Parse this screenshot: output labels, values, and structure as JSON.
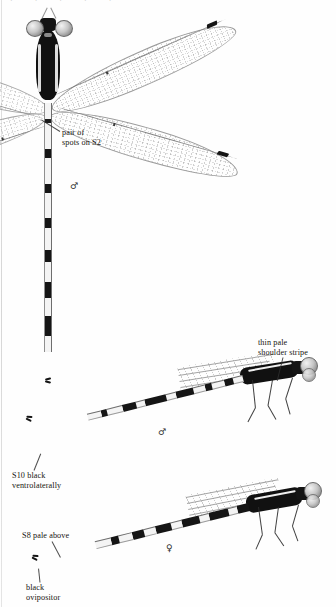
{
  "plate": {
    "title": "Damselfly identification plate",
    "background_color": "#fefefe",
    "ink_color": "#141414",
    "cutoff_text": "· · · · ·"
  },
  "annotations": [
    {
      "id": "pair-of-spots",
      "text": "pair of\nspots on S2",
      "x": 62,
      "y": 128,
      "align": "left",
      "leader": {
        "x": 60,
        "y": 131,
        "length": 22,
        "angle": -148
      }
    },
    {
      "id": "thin-pale-shoulder-stripe",
      "text": "thin pale\nshoulder stripe",
      "x": 258,
      "y": 338,
      "align": "left",
      "leader": {
        "x": 283,
        "y": 357,
        "length": 24,
        "angle": 104
      }
    },
    {
      "id": "s10-black-ventrolaterally",
      "text": "S10 black\nventrolaterally",
      "x": 12,
      "y": 471,
      "align": "left",
      "leader": {
        "x": 34,
        "y": 470,
        "length": 18,
        "angle": -68
      }
    },
    {
      "id": "s8-pale-above",
      "text": "S8 pale above",
      "x": 22,
      "y": 531,
      "align": "left",
      "leader": {
        "x": 52,
        "y": 541,
        "length": 18,
        "angle": 62
      }
    },
    {
      "id": "black-ovipositor",
      "text": "black\novipositor",
      "x": 26,
      "y": 583,
      "align": "left",
      "leader": {
        "x": 40,
        "y": 582,
        "length": 14,
        "angle": -96
      }
    }
  ],
  "sex_symbols": [
    {
      "id": "male-dorsal",
      "glyph": "♂",
      "x": 70,
      "y": 181
    },
    {
      "id": "male-lateral",
      "glyph": "♂",
      "x": 158,
      "y": 427
    },
    {
      "id": "female-lateral",
      "glyph": "♀",
      "x": 166,
      "y": 543
    }
  ],
  "specimens": [
    {
      "id": "specimen-dorsal-male",
      "view": "dorsal",
      "sex": "male",
      "wings": 4,
      "abdomen_segments": 10,
      "pterostigma_color": "#161616"
    },
    {
      "id": "specimen-lateral-male",
      "view": "lateral",
      "sex": "male",
      "wings": 4,
      "abdomen_segments": 10,
      "pterostigma_color": "#161616"
    },
    {
      "id": "specimen-lateral-female",
      "view": "lateral",
      "sex": "female",
      "wings": 4,
      "abdomen_segments": 10,
      "pterostigma_color": "#161616"
    }
  ],
  "abdomen_pattern_dorsal": [
    {
      "len": 16,
      "type": "pale"
    },
    {
      "len": 4,
      "type": "ring"
    },
    {
      "len": 26,
      "type": "pale"
    },
    {
      "len": 9,
      "type": "dark"
    },
    {
      "len": 26,
      "type": "pale"
    },
    {
      "len": 9,
      "type": "dark"
    },
    {
      "len": 25,
      "type": "pale"
    },
    {
      "len": 10,
      "type": "dark"
    },
    {
      "len": 22,
      "type": "pale"
    },
    {
      "len": 12,
      "type": "dark"
    },
    {
      "len": 20,
      "type": "pale"
    },
    {
      "len": 16,
      "type": "dark"
    },
    {
      "len": 18,
      "type": "pale"
    },
    {
      "len": 20,
      "type": "dark"
    },
    {
      "len": 16,
      "type": "pale"
    }
  ],
  "abdomen_pattern_lateral_male": [
    {
      "len": 10,
      "type": "pale"
    },
    {
      "len": 9,
      "type": "dark"
    },
    {
      "len": 13,
      "type": "pale"
    },
    {
      "len": 7,
      "type": "dark"
    },
    {
      "len": 12,
      "type": "pale"
    },
    {
      "len": 18,
      "type": "dark"
    },
    {
      "len": 10,
      "type": "pale"
    },
    {
      "len": 22,
      "type": "dark"
    },
    {
      "len": 9,
      "type": "pale"
    },
    {
      "len": 14,
      "type": "dark"
    },
    {
      "len": 16,
      "type": "pale"
    },
    {
      "len": 6,
      "type": "dark"
    },
    {
      "len": 14,
      "type": "pale"
    }
  ],
  "abdomen_pattern_lateral_female": [
    {
      "len": 12,
      "type": "dark"
    },
    {
      "len": 9,
      "type": "pale"
    },
    {
      "len": 20,
      "type": "dark"
    },
    {
      "len": 10,
      "type": "pale"
    },
    {
      "len": 18,
      "type": "dark"
    },
    {
      "len": 11,
      "type": "pale"
    },
    {
      "len": 16,
      "type": "dark"
    },
    {
      "len": 12,
      "type": "pale"
    },
    {
      "len": 12,
      "type": "dark"
    },
    {
      "len": 14,
      "type": "pale"
    },
    {
      "len": 8,
      "type": "dark"
    },
    {
      "len": 16,
      "type": "pale"
    }
  ]
}
